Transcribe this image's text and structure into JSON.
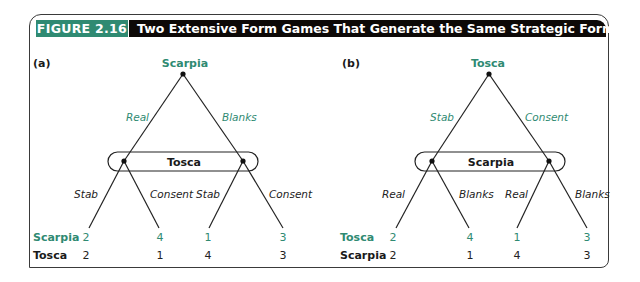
{
  "figure": {
    "label": "FIGURE 2.16",
    "title": "Two Extensive Form Games That Generate the Same Strategic Form Game",
    "accent_color": "#2f8a72",
    "title_bar_color": "#0d0907"
  },
  "panels": [
    {
      "id": "(a)",
      "root_player": "Scarpia",
      "root_actions": [
        "Real",
        "Blanks"
      ],
      "info_set_player": "Tosca",
      "info_set_actions": [
        "Stab",
        "Consent",
        "Stab",
        "Consent"
      ],
      "payoff_rows": [
        {
          "player": "Scarpia",
          "values": [
            "2",
            "4",
            "1",
            "3"
          ]
        },
        {
          "player": "Tosca",
          "values": [
            "2",
            "1",
            "4",
            "3"
          ]
        }
      ]
    },
    {
      "id": "(b)",
      "root_player": "Tosca",
      "root_actions": [
        "Stab",
        "Consent"
      ],
      "info_set_player": "Scarpia",
      "info_set_actions": [
        "Real",
        "Blanks",
        "Real",
        "Blanks"
      ],
      "payoff_rows": [
        {
          "player": "Tosca",
          "values": [
            "2",
            "4",
            "1",
            "3"
          ]
        },
        {
          "player": "Scarpia",
          "values": [
            "2",
            "1",
            "4",
            "3"
          ]
        }
      ]
    }
  ]
}
